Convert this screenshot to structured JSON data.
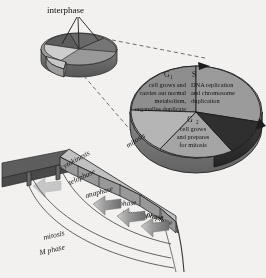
{
  "figure": {
    "title_label": "interphase",
    "background_color": "#f4f3f1"
  },
  "small_pie": {
    "name": "interphase-overview-pie",
    "label": "interphase",
    "wedge_count": 4,
    "exploded_wedge": "M phase"
  },
  "main_pie": {
    "name": "cell-cycle-pie",
    "sectors": [
      {
        "key": "G1",
        "name": "G",
        "subscript": "1",
        "lines": [
          "cell grows and",
          "carries out normal",
          "metabolism,",
          "organelles duplicate"
        ],
        "fill": "#8e8e8e"
      },
      {
        "key": "S",
        "name": "S",
        "subscript": "",
        "lines": [
          "DNA replication",
          "and chromosome",
          "duplication"
        ],
        "fill": "#9a9a9a"
      },
      {
        "key": "G2",
        "name": "G",
        "subscript": "2",
        "lines": [
          "cell grows",
          "and prepares",
          "for mitosis"
        ],
        "fill": "#a0a0a0"
      },
      {
        "key": "M",
        "name": "mitosis",
        "subscript": "",
        "lines": [],
        "fill": "#3a3a3a"
      }
    ]
  },
  "mitosis_callout": {
    "label": "mitosis"
  },
  "fan": {
    "name": "mitosis-phase-fan",
    "segments": [
      {
        "label": "cytokinesis"
      },
      {
        "label": "telophase"
      },
      {
        "label": "anaphase"
      },
      {
        "label": "metaphase"
      },
      {
        "label": "prometaphase"
      },
      {
        "label": "prophase"
      }
    ],
    "arrow_count": 3,
    "arrow_direction": "left"
  },
  "brackets": [
    {
      "label": "mitosis"
    },
    {
      "label": "M phase"
    }
  ],
  "colors": {
    "ink": "#141414",
    "pie_light": "#a3a3a3",
    "pie_mid": "#8e8e8e",
    "pie_dark": "#3a3a3a",
    "fan_face": "#b9b9b9",
    "fan_side": "#7e7e7e",
    "arrow": "#8a8a8a",
    "background": "#f4f3f1"
  }
}
